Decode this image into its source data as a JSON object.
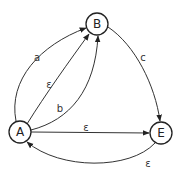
{
  "diagram": {
    "type": "state-transition-graph",
    "nodes": [
      {
        "id": "A",
        "label": "A",
        "cx": 20,
        "cy": 132
      },
      {
        "id": "B",
        "label": "B",
        "cx": 97,
        "cy": 24
      },
      {
        "id": "E",
        "label": "E",
        "cx": 161,
        "cy": 133
      }
    ],
    "edges": [
      {
        "from": "A",
        "to": "B",
        "label": "a"
      },
      {
        "from": "A",
        "to": "B",
        "label": "ε"
      },
      {
        "from": "A",
        "to": "B",
        "label": "b"
      },
      {
        "from": "B",
        "to": "E",
        "label": "c"
      },
      {
        "from": "A",
        "to": "E",
        "label": "ε"
      },
      {
        "from": "E",
        "to": "A",
        "label": "ε"
      }
    ]
  }
}
